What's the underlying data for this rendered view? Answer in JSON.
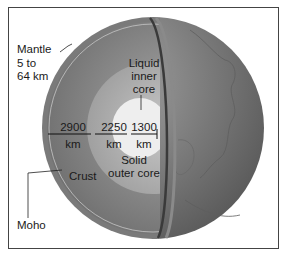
{
  "diagram": {
    "labels": {
      "mantle": "Mantle",
      "mantle_range_1": "5 to",
      "mantle_range_2": "64 km",
      "crust": "Crust",
      "moho": "Moho",
      "liquid_inner_1": "Liquid",
      "liquid_inner_2": "inner",
      "liquid_inner_3": "core",
      "solid_outer_1": "Solid",
      "solid_outer_2": "outer core"
    },
    "measurements": [
      {
        "value": "2900",
        "unit": "km"
      },
      {
        "value": "2250",
        "unit": "km"
      },
      {
        "value": "1300",
        "unit": "km"
      }
    ],
    "colors": {
      "outer_shell": "#6e6e6e",
      "mantle": "#8c8c8c",
      "outer_core": "#b4b4b4",
      "inner_core": "#ececec",
      "frame": "#444444"
    }
  }
}
